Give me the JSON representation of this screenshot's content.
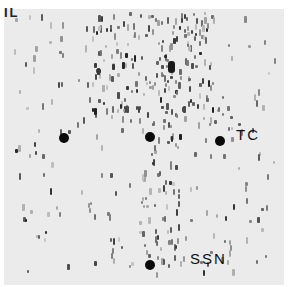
{
  "figure": {
    "corner_label": "IL",
    "markers": [
      {
        "id": "left",
        "x": 64,
        "y": 138
      },
      {
        "id": "center",
        "x": 150,
        "y": 137
      },
      {
        "id": "tc",
        "x": 220,
        "y": 141
      },
      {
        "id": "ssn",
        "x": 150,
        "y": 265
      }
    ],
    "labels": {
      "tc": "TC",
      "ssn": "SSN"
    },
    "colors": {
      "background": "#ebebeb",
      "spot": "#555555",
      "marker": "#0a0a0a"
    }
  }
}
